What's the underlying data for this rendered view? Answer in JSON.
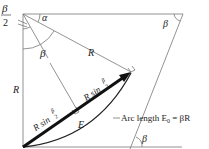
{
  "diagram": {
    "type": "geometry",
    "labels": {
      "beta_half_num": "β",
      "beta_half_den": "2",
      "alpha": "α",
      "beta_top_right": "β",
      "beta_center": "β",
      "R_radius": "R",
      "R_left": "R",
      "chord_left": "R sin",
      "chord_left_frac_num": "β",
      "chord_left_frac_den": "2",
      "chord_right": "R sin",
      "chord_right_frac_num": "β",
      "chord_right_frac_den": "2",
      "E": "E",
      "arc_length": "Arc length E",
      "arc_length_sub": "0",
      "arc_length_eq": " = βR",
      "beta_bottom": "β"
    },
    "colors": {
      "line": "#666666",
      "arrow": "#111111",
      "text": "#222222"
    }
  }
}
